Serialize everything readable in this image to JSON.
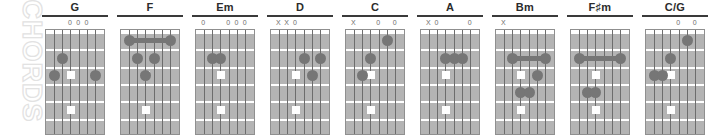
{
  "watermark": {
    "text": "CHORDS"
  },
  "board": {
    "strings": 6,
    "frets": 6,
    "inlay_string_index": 3,
    "inlay_frets": [
      3,
      5,
      7
    ],
    "colors": {
      "fretboard": "#b4b4b4",
      "fret_line": "#ffffff",
      "string_line": "#6d6d6d",
      "finger_dot": "#767676",
      "inlay_dot": "#ffffff",
      "name_rule": "#3a3a3a",
      "marker_text": "#6e6e6e",
      "watermark": "#e2e2e2"
    }
  },
  "chords": [
    {
      "name": "G",
      "markers": [
        "",
        "",
        "0",
        "0",
        "0",
        ""
      ],
      "dots": [
        {
          "string": 6,
          "fret": 3
        },
        {
          "string": 5,
          "fret": 2
        },
        {
          "string": 1,
          "fret": 3
        }
      ],
      "barres": []
    },
    {
      "name": "F",
      "markers": [
        "",
        "",
        "",
        "",
        "",
        ""
      ],
      "dots": [
        {
          "string": 4,
          "fret": 3
        },
        {
          "string": 3,
          "fret": 2
        },
        {
          "string": 5,
          "fret": 2
        }
      ],
      "barres": [
        {
          "fret": 1,
          "from_string": 6,
          "to_string": 1
        }
      ]
    },
    {
      "name": "Em",
      "markers": [
        "0",
        "",
        "",
        "0",
        "0",
        "0"
      ],
      "dots": [
        {
          "string": 5,
          "fret": 2
        },
        {
          "string": 4,
          "fret": 2
        }
      ],
      "barres": []
    },
    {
      "name": "D",
      "markers": [
        "X",
        "X",
        "0",
        "",
        "",
        ""
      ],
      "dots": [
        {
          "string": 3,
          "fret": 2
        },
        {
          "string": 1,
          "fret": 2
        },
        {
          "string": 2,
          "fret": 3
        }
      ],
      "barres": []
    },
    {
      "name": "C",
      "markers": [
        "X",
        "",
        "",
        "0",
        "",
        "0"
      ],
      "dots": [
        {
          "string": 2,
          "fret": 1
        },
        {
          "string": 4,
          "fret": 2
        },
        {
          "string": 5,
          "fret": 3
        }
      ],
      "barres": []
    },
    {
      "name": "A",
      "markers": [
        "X",
        "0",
        "",
        "",
        "",
        "0"
      ],
      "dots": [
        {
          "string": 4,
          "fret": 2
        },
        {
          "string": 3,
          "fret": 2
        },
        {
          "string": 2,
          "fret": 2
        }
      ],
      "barres": []
    },
    {
      "name": "Bm",
      "markers": [
        "X",
        "",
        "",
        "",
        "",
        ""
      ],
      "dots": [
        {
          "string": 4,
          "fret": 4
        },
        {
          "string": 3,
          "fret": 4
        },
        {
          "string": 2,
          "fret": 3
        }
      ],
      "barres": [
        {
          "fret": 2,
          "from_string": 5,
          "to_string": 1
        }
      ]
    },
    {
      "name": "F♯m",
      "markers": [
        "",
        "",
        "",
        "",
        "",
        ""
      ],
      "dots": [
        {
          "string": 5,
          "fret": 4
        },
        {
          "string": 4,
          "fret": 4
        }
      ],
      "barres": [
        {
          "fret": 2,
          "from_string": 6,
          "to_string": 1
        }
      ]
    },
    {
      "name": "C/G",
      "markers": [
        "",
        "",
        "",
        "0",
        "",
        "0"
      ],
      "dots": [
        {
          "string": 6,
          "fret": 3
        },
        {
          "string": 5,
          "fret": 3
        },
        {
          "string": 4,
          "fret": 2
        },
        {
          "string": 2,
          "fret": 1
        }
      ],
      "barres": []
    }
  ]
}
